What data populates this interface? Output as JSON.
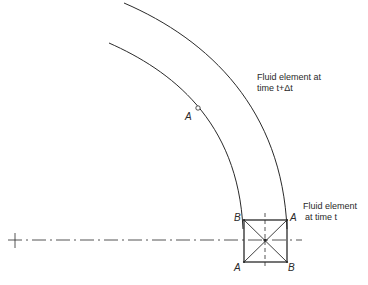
{
  "diagram": {
    "type": "fluid-element-rotation-figure",
    "labels": {
      "later_element_line1": "Fluid element at",
      "later_element_line2": "time t+Δt",
      "current_element_line1": "Fluid element",
      "current_element_line2": "at time t"
    },
    "points": {
      "a_on_arc": "A",
      "box_top_left": "B",
      "box_top_right": "A",
      "box_bottom_left": "A",
      "box_bottom_right": "B"
    },
    "colors": {
      "stroke": "#2a2a2a",
      "background": "#ffffff"
    }
  }
}
